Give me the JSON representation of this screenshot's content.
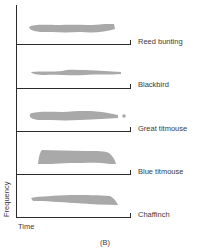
{
  "figure": {
    "caption": "(B)",
    "x_axis_label": "Time",
    "y_axis_label": "Frequency",
    "colors": {
      "axis": "#2b2b2b",
      "song_trace": "#a9a9a9",
      "text": "#3a3a3a"
    },
    "panels": [
      {
        "species": "Reed bunting",
        "baseline_y": 44
      },
      {
        "species": "Blackbird",
        "baseline_y": 88
      },
      {
        "species": "Great titmouse",
        "baseline_y": 131
      },
      {
        "species": "Blue titmouse",
        "baseline_y": 174
      },
      {
        "species": "Chaffinch",
        "baseline_y": 217
      }
    ]
  }
}
